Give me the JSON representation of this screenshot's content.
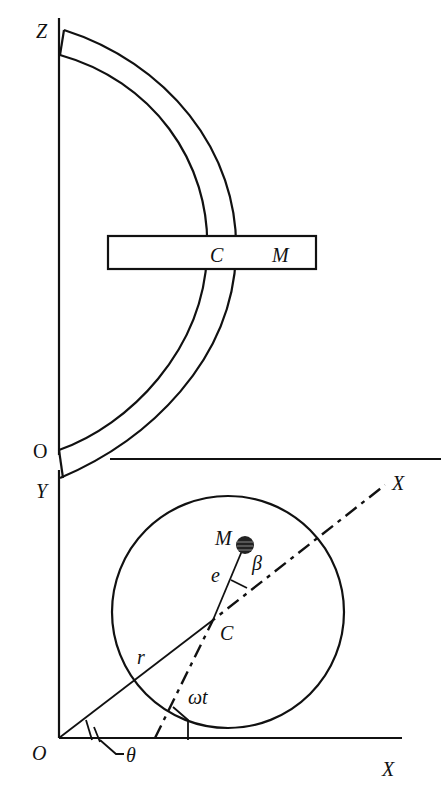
{
  "figure": {
    "top_view": {
      "labels": {
        "z_axis": "Z",
        "origin": "O",
        "center": "C",
        "mass": "M"
      }
    },
    "bottom_view": {
      "labels": {
        "y_axis": "Y",
        "origin": "O",
        "x_axis": "X",
        "rotating_axis": "X",
        "center": "C",
        "mass": "M",
        "eccentricity": "e",
        "angle_beta": "β",
        "radius": "r",
        "angle_omega_t": "ωt",
        "angle_theta": "θ"
      }
    },
    "colors": {
      "stroke": "#111111",
      "background": "#ffffff"
    }
  }
}
